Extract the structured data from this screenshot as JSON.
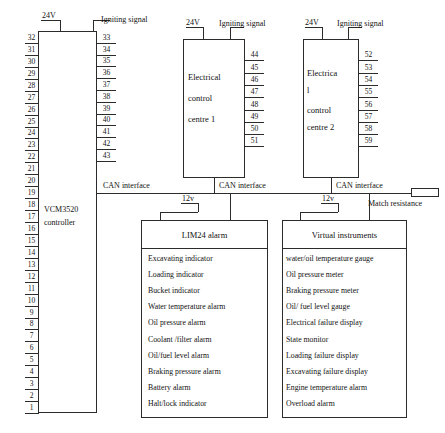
{
  "diagram": {
    "power_label_1": "24V",
    "power_label_2": "24V",
    "power_label_3": "24V",
    "ignition_label_1": "Igniting signal",
    "ignition_label_2": "Igniting signal",
    "ignition_label_3": "Igniting signal",
    "low_power_label_1": "12v",
    "low_power_label_2": "12v",
    "can_label_1": "CAN interface",
    "can_label_2": "CAN interface",
    "can_label_3": "CAN interface",
    "match_resistance_label": "Match resistance"
  },
  "controller": {
    "name_line1": "VCM3520",
    "name_line2": "controller",
    "left_pins": [
      "32",
      "31",
      "30",
      "29",
      "28",
      "27",
      "26",
      "25",
      "24",
      "23",
      "22",
      "21",
      "20",
      "19",
      "18",
      "17",
      "16",
      "15",
      "14",
      "13",
      "12",
      "11",
      "10",
      "9",
      "8",
      "7",
      "6",
      "5",
      "4",
      "3",
      "2",
      "1"
    ],
    "right_pins": [
      "33",
      "34",
      "35",
      "36",
      "37",
      "38",
      "39",
      "40",
      "41",
      "42",
      "43"
    ]
  },
  "control_centre_1": {
    "label_lines": [
      "Electrical",
      "control",
      "centre 1"
    ],
    "pins": [
      "44",
      "45",
      "46",
      "47",
      "48",
      "49",
      "50",
      "51"
    ]
  },
  "control_centre_2": {
    "label_lines": [
      "Electrica",
      "l",
      "control",
      "centre 2"
    ],
    "pins": [
      "52",
      "53",
      "54",
      "55",
      "56",
      "57",
      "58",
      "59"
    ]
  },
  "lim24_alarm": {
    "header": "LIM24 alarm",
    "items": [
      "Excavating indicator",
      "Loading indicator",
      "Bucket indicator",
      "Water temperature alarm",
      "Oil pressure alarm",
      "Coolant /filter alarm",
      "Oil/fuel level alarm",
      "Braking pressure alarm",
      "Battery alarm",
      "Halt/lock indicator"
    ]
  },
  "virtual_instruments": {
    "header": "Virtual instruments",
    "items": [
      "water/oil temperature gauge",
      "Oil pressure meter",
      "Braking pressure meter",
      "Oil/ fuel level gauge",
      "Electrical failure display",
      "State monitor",
      "Loading failure display",
      "Excavating failure display",
      "Engine temperature alarm",
      "Overload alarm"
    ]
  }
}
